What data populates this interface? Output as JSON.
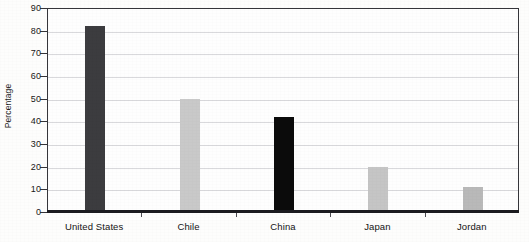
{
  "chart_data": {
    "type": "bar",
    "title": "",
    "xlabel": "",
    "ylabel": "Percentage",
    "categories": [
      "United States",
      "Chile",
      "China",
      "Japan",
      "Jordan"
    ],
    "values": [
      82,
      50,
      42,
      20,
      11
    ],
    "bar_colors": [
      "#3c3c3f",
      "#c9c9c9",
      "#0b0b0b",
      "#c5c5c5",
      "#b9b9b9"
    ],
    "ylim": [
      0,
      90
    ],
    "yticks": [
      0,
      10,
      20,
      30,
      40,
      50,
      60,
      70,
      80,
      90
    ],
    "ytick_labels": [
      "0",
      "10",
      "20",
      "30",
      "40",
      "50",
      "60",
      "70",
      "80",
      "90"
    ],
    "grid": true,
    "grid_axis": "y",
    "legend": false,
    "legend_position": "none",
    "axis_color": "#35353a",
    "grid_color": "#d9d9dc",
    "background": "#fefefe"
  }
}
